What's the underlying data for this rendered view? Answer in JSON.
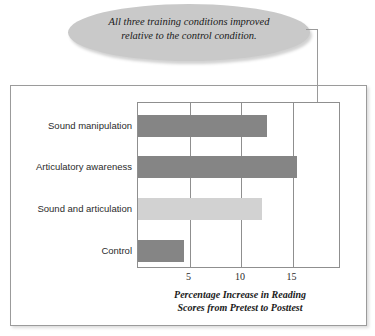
{
  "callout": {
    "line1": "All three training conditions improved",
    "line2": "relative to the control condition.",
    "shape": "ellipse-icon",
    "fill": "#c9c9c9"
  },
  "axis_title": {
    "line1": "Percentage Increase in Reading",
    "line2": "Scores from Pretest to Posttest"
  },
  "colors": {
    "bar_dark": "#858585",
    "bar_light": "#d2d2d2",
    "frame": "#9b9b9b",
    "gridline": "#8f8f8f",
    "leader": "#9a9a9a"
  },
  "chart_data": {
    "type": "bar",
    "orientation": "horizontal",
    "title": "",
    "subtitle": "",
    "xlabel": "Percentage Increase in Reading Scores from Pretest to Posttest",
    "ylabel": "",
    "categories": [
      "Sound manipulation",
      "Articulatory awareness",
      "Sound and articulation",
      "Control"
    ],
    "values": [
      12.5,
      15.4,
      12.0,
      4.5
    ],
    "bar_colors": [
      "#858585",
      "#858585",
      "#d2d2d2",
      "#858585"
    ],
    "xlim": [
      0,
      19.5
    ],
    "xticks": [
      5,
      10,
      15
    ],
    "xticklabels": [
      "5",
      "10",
      "15"
    ],
    "grid": "vertical-only",
    "legend": "none",
    "annotations": [
      {
        "text": "All three training conditions improved relative to the control condition.",
        "points_to": [
          "Sound manipulation",
          "Articulatory awareness",
          "Sound and articulation"
        ]
      }
    ]
  }
}
